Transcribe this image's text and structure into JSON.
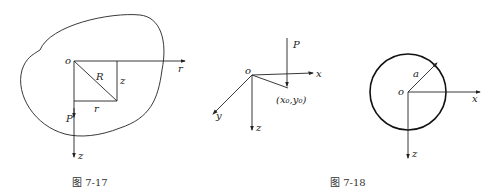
{
  "figures": [
    {
      "caption": "图 7-17",
      "labels": {
        "origin": "o",
        "radius": "R",
        "z_side": "z",
        "r_side": "r",
        "r_axis": "r",
        "force": "P",
        "z_axis": "z"
      }
    },
    {
      "caption": "图 7-18",
      "labels": {
        "force": "P",
        "origin": "o",
        "x_axis": "x",
        "y_axis": "y",
        "z_axis": "z",
        "point": "(x₀,y₀)"
      },
      "circle_labels": {
        "radius": "a",
        "origin": "o",
        "x_axis": "x",
        "z_axis": "z"
      }
    }
  ]
}
